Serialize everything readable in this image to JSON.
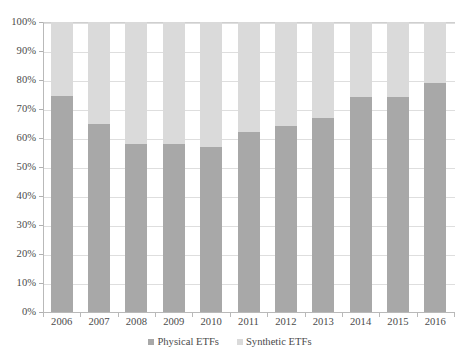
{
  "title": {
    "text": "FIGURE 4: PHYSICAL AND SYNTHETIC SHARE OF EUROPEAN ETF MARKET, PERCENTAGE OF ASSETS"
  },
  "chart_data": {
    "type": "bar",
    "subtype": "stacked-percentage",
    "title": "",
    "xlabel": "",
    "ylabel": "",
    "ylim": [
      0,
      100
    ],
    "ytick_labels": [
      "0%",
      "10%",
      "20%",
      "30%",
      "40%",
      "50%",
      "60%",
      "70%",
      "80%",
      "90%",
      "100%"
    ],
    "ytick_values": [
      0,
      10,
      20,
      30,
      40,
      50,
      60,
      70,
      80,
      90,
      100
    ],
    "grid": true,
    "legend_position": "bottom",
    "categories": [
      "2006",
      "2007",
      "2008",
      "2009",
      "2010",
      "2011",
      "2012",
      "2013",
      "2014",
      "2015",
      "2016"
    ],
    "series": [
      {
        "name": "Physical ETFs",
        "color": "#a8a8a8",
        "values": [
          74.5,
          65,
          58,
          58,
          57,
          62,
          64,
          67,
          74,
          74,
          79
        ]
      },
      {
        "name": "Synthetic ETFs",
        "color": "#dadada",
        "values": [
          25.5,
          35,
          42,
          42,
          43,
          38,
          36,
          33,
          26,
          26,
          21
        ]
      }
    ]
  },
  "legend": {
    "entries": [
      {
        "label": "Physical ETFs",
        "color": "#a8a8a8"
      },
      {
        "label": "Synthetic ETFs",
        "color": "#dadada"
      }
    ]
  }
}
